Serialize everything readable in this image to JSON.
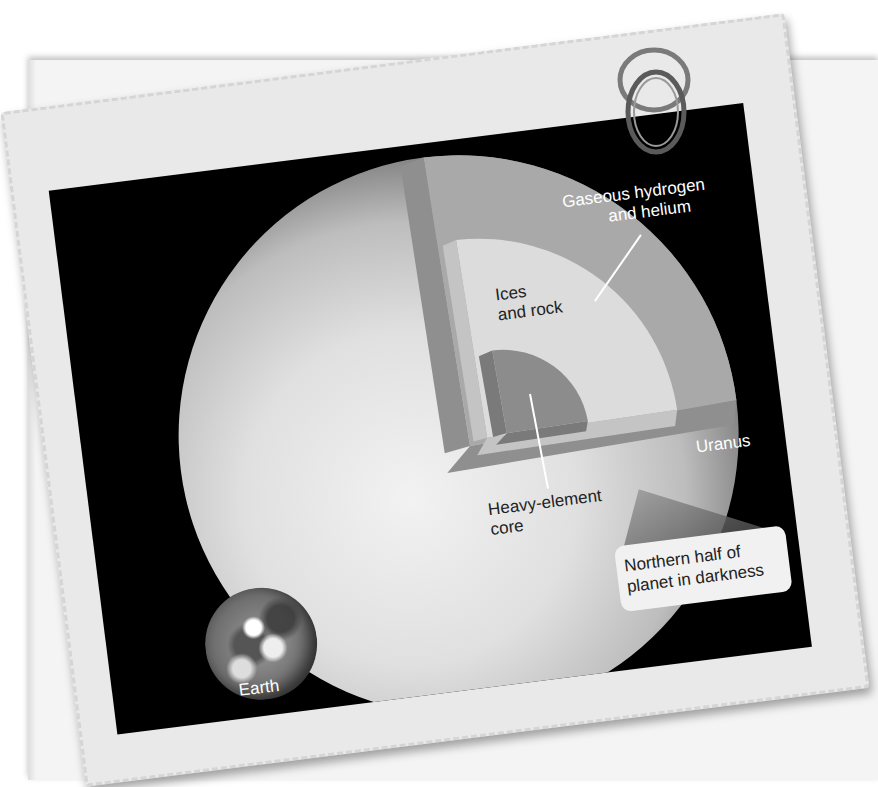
{
  "figure": {
    "planet_label": "Uranus",
    "earth_label": "Earth",
    "layers": [
      {
        "name": "outer-layer",
        "label_line1": "Gaseous hydrogen",
        "label_line2": "and helium",
        "color": "#a9a9a9"
      },
      {
        "name": "mantle",
        "label_line1": "Ices",
        "label_line2": "and rock",
        "color": "#dcdcdc"
      },
      {
        "name": "core",
        "label_line1": "Heavy-element",
        "label_line2": "core",
        "color": "#8c8c8c"
      }
    ],
    "callout": {
      "line1": "Northern half of",
      "line2": "planet in darkness"
    }
  },
  "colors": {
    "background": "#ffffff",
    "card_paper": "#e9e9e9",
    "space": "#000000",
    "label_text": "#ffffff",
    "dark_text": "#222222"
  }
}
